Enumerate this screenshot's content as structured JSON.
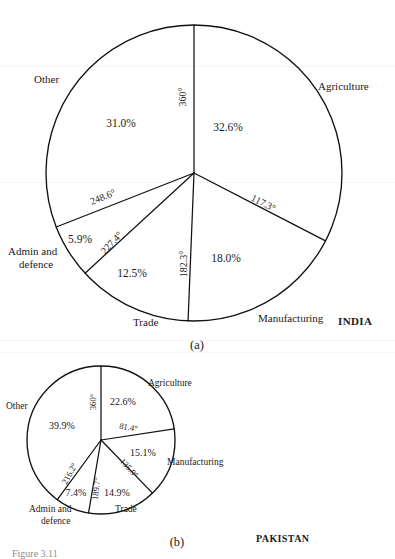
{
  "figure": {
    "caption_bottom": "Figure 3.11",
    "panel_a_caption": "(a)",
    "panel_b_caption": "(b)"
  },
  "chart_data": [
    {
      "type": "pie",
      "id": "india-pie",
      "title": "INDIA",
      "panel": "(a)",
      "center": {
        "x": 194,
        "y": 173
      },
      "radius": 148,
      "start_angle_deg": 0,
      "direction": "clockwise",
      "categories": [
        "Agriculture",
        "Manufacturing",
        "Trade",
        "Admin and defence",
        "Other"
      ],
      "values": [
        32.6,
        18.0,
        12.5,
        5.9,
        31.0
      ],
      "value_labels": [
        "32.6%",
        "18.0%",
        "12.5%",
        "5.9%",
        "31.0%"
      ],
      "cumulative_angle_labels": [
        "117.3°",
        "182.3°",
        "227.4°",
        "248.6°",
        "360°"
      ],
      "cumulative_angles_deg": [
        117.3,
        182.3,
        227.4,
        248.6,
        360
      ],
      "label_positions": [
        {
          "label": "Agriculture",
          "x": 318,
          "y": 90,
          "anchor": "start"
        },
        {
          "label": "Manufacturing",
          "x": 258,
          "y": 322,
          "anchor": "start"
        },
        {
          "label": "Trade",
          "x": 133,
          "y": 326,
          "anchor": "start"
        },
        {
          "label": "Admin and",
          "x": 8,
          "y": 255,
          "anchor": "start"
        },
        {
          "label": "defence",
          "x": 19,
          "y": 268,
          "anchor": "start"
        },
        {
          "label": "Other",
          "x": 34,
          "y": 83,
          "anchor": "start"
        }
      ],
      "pct_positions": [
        {
          "label": "32.6%",
          "x": 228,
          "y": 131
        },
        {
          "label": "18.0%",
          "x": 226,
          "y": 262
        },
        {
          "label": "12.5%",
          "x": 132,
          "y": 277
        },
        {
          "label": "5.9%",
          "x": 80,
          "y": 243
        },
        {
          "label": "31.0%",
          "x": 121,
          "y": 127
        }
      ],
      "deg_positions": [
        {
          "label": "360°",
          "x": 186,
          "y": 97,
          "rotate": -90
        },
        {
          "label": "117.3°",
          "x": 262,
          "y": 206,
          "rotate": 27
        },
        {
          "label": "182.3°",
          "x": 187,
          "y": 264,
          "rotate": -90
        },
        {
          "label": "227.4°",
          "x": 114,
          "y": 245,
          "rotate": -47
        },
        {
          "label": "248.6°",
          "x": 104,
          "y": 200,
          "rotate": -22
        }
      ],
      "country_position": {
        "x": 338,
        "y": 325
      }
    },
    {
      "type": "pie",
      "id": "pakistan-pie",
      "title": "PAKISTAN",
      "panel": "(b)",
      "center": {
        "x": 101,
        "y": 440
      },
      "radius": 74,
      "start_angle_deg": 0,
      "direction": "clockwise",
      "categories": [
        "Agriculture",
        "Manufacturing",
        "Trade",
        "Admin and defence",
        "Other"
      ],
      "values": [
        22.6,
        15.1,
        14.9,
        7.4,
        39.9
      ],
      "value_labels": [
        "22.6%",
        "15.1%",
        "14.9%",
        "7.4%",
        "39.9%"
      ],
      "cumulative_angle_labels": [
        "81.4°",
        "135.9°",
        "189.7°",
        "216.2°",
        "360°"
      ],
      "cumulative_angles_deg": [
        81.4,
        135.9,
        189.7,
        216.2,
        360
      ],
      "label_positions": [
        {
          "label": "Agriculture",
          "x": 148,
          "y": 386,
          "anchor": "start"
        },
        {
          "label": "Manufacturing",
          "x": 167,
          "y": 465,
          "anchor": "start"
        },
        {
          "label": "Trade",
          "x": 115,
          "y": 512,
          "anchor": "start"
        },
        {
          "label": "Admin and",
          "x": 29,
          "y": 512,
          "anchor": "start"
        },
        {
          "label": "defence",
          "x": 41,
          "y": 524,
          "anchor": "start"
        },
        {
          "label": "Other",
          "x": 6,
          "y": 409,
          "anchor": "start"
        }
      ],
      "pct_positions": [
        {
          "label": "22.6%",
          "x": 123,
          "y": 405
        },
        {
          "label": "15.1%",
          "x": 143,
          "y": 456
        },
        {
          "label": "14.9%",
          "x": 117,
          "y": 496
        },
        {
          "label": "7.4%",
          "x": 76,
          "y": 496
        },
        {
          "label": "39.9%",
          "x": 62,
          "y": 429
        }
      ],
      "deg_positions": [
        {
          "label": "360°",
          "x": 96,
          "y": 402,
          "rotate": -90
        },
        {
          "label": "81.4°",
          "x": 128,
          "y": 430,
          "rotate": 10
        },
        {
          "label": "135.9°",
          "x": 127,
          "y": 470,
          "rotate": 48
        },
        {
          "label": "189.7°",
          "x": 99,
          "y": 489,
          "rotate": -84
        },
        {
          "label": "216.2°",
          "x": 72,
          "y": 475,
          "rotate": -61
        }
      ],
      "country_position": {
        "x": 256,
        "y": 542
      }
    }
  ]
}
